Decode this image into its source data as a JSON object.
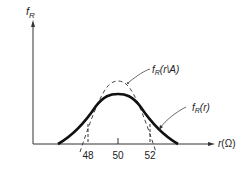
{
  "figure": {
    "y_axis_label": "f",
    "y_axis_label_sub": "R",
    "x_axis_label": "r(Ω)",
    "curves": [
      {
        "name": "conditional-pdf",
        "label_main": "f",
        "label_sub": "R",
        "label_args": "(r\\A)",
        "style": "dashed"
      },
      {
        "name": "pdf",
        "label_main": "f",
        "label_sub": "R",
        "label_args": "(r)",
        "style": "solid-thick"
      }
    ],
    "ticks": [
      {
        "value": "48"
      },
      {
        "value": "50"
      },
      {
        "value": "52"
      }
    ]
  }
}
